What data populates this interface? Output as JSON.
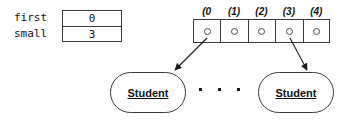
{
  "diagram": {
    "variable_table": {
      "rows": [
        {
          "name": "first",
          "value": "0"
        },
        {
          "name": "small",
          "value": "3"
        }
      ]
    },
    "array": {
      "index_labels": [
        "(0",
        "(1)",
        "(2)",
        "(3)",
        "(4)"
      ],
      "cell_count": 5,
      "cell_contents": [
        "pointer-dot",
        "pointer-dot",
        "pointer-dot",
        "pointer-dot",
        "pointer-dot"
      ]
    },
    "objects": [
      {
        "label": "Student"
      },
      {
        "label": "Student"
      }
    ],
    "ellipsis": "...",
    "pointers": [
      {
        "from_index": 0,
        "to_object": 0
      },
      {
        "from_index": 3,
        "to_object": 1
      }
    ],
    "colors": {
      "stroke": "#3a3a3a",
      "text": "#111111",
      "background": "#ffffff"
    }
  }
}
